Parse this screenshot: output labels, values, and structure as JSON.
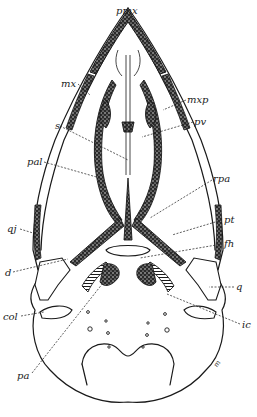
{
  "figure": {
    "stroke_color": "#1a1a1a",
    "fill_stipple_color": "#2a2a2a",
    "background": "#ffffff"
  },
  "labels": [
    {
      "id": "pmx",
      "text": "pmx",
      "x": 116,
      "y": 6,
      "target": [
        127,
        22
      ]
    },
    {
      "id": "mx",
      "text": "mx",
      "x": 61,
      "y": 79,
      "target": [
        90,
        95
      ]
    },
    {
      "id": "mxp",
      "text": "mxp",
      "x": 187,
      "y": 95,
      "target": [
        163,
        110
      ]
    },
    {
      "id": "s",
      "text": "s",
      "x": 55,
      "y": 121,
      "target": [
        128,
        160
      ]
    },
    {
      "id": "pv",
      "text": "pv",
      "x": 194,
      "y": 117,
      "target": [
        142,
        137
      ]
    },
    {
      "id": "pal",
      "text": "pal",
      "x": 27,
      "y": 157,
      "target": [
        100,
        178
      ]
    },
    {
      "id": "rpa",
      "text": "rpa",
      "x": 213,
      "y": 174,
      "target": [
        150,
        218
      ]
    },
    {
      "id": "qj",
      "text": "qj",
      "x": 7,
      "y": 224,
      "target": [
        33,
        233
      ]
    },
    {
      "id": "pt",
      "text": "pt",
      "x": 224,
      "y": 215,
      "target": [
        172,
        235
      ]
    },
    {
      "id": "fh",
      "text": "fh",
      "x": 224,
      "y": 239,
      "target": [
        140,
        258
      ]
    },
    {
      "id": "d",
      "text": "d",
      "x": 5,
      "y": 268,
      "target": [
        68,
        259
      ]
    },
    {
      "id": "q",
      "text": "q",
      "x": 236,
      "y": 282,
      "target": [
        209,
        287
      ]
    },
    {
      "id": "col",
      "text": "col",
      "x": 3,
      "y": 312,
      "target": [
        44,
        312
      ]
    },
    {
      "id": "ic",
      "text": "ic",
      "x": 242,
      "y": 320,
      "target": [
        167,
        294
      ]
    },
    {
      "id": "pa",
      "text": "pa",
      "x": 17,
      "y": 371,
      "target": [
        103,
        283
      ]
    }
  ],
  "signature": {
    "text": "m",
    "x": 214,
    "y": 360
  }
}
